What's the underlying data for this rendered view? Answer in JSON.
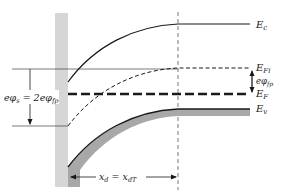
{
  "diagram": {
    "colors": {
      "line": "#1a1a1a",
      "oxide": "#d6d6d6",
      "valence_fill": "#a8a8a8",
      "guide": "#555555",
      "background": "#ffffff"
    },
    "labels": {
      "ec": {
        "main": "E",
        "sub": "c"
      },
      "efi": {
        "main": "E",
        "sub": "Fi"
      },
      "ef": {
        "main": "E",
        "sub": "F"
      },
      "ev": {
        "main": "E",
        "sub": "v"
      },
      "phi_fp": {
        "main": "eφ",
        "sub": "fp"
      },
      "phi_s": {
        "left_main": "eφ",
        "left_sub": "s",
        "eq": " = 2eφ",
        "right_sub": "fp"
      },
      "xd": {
        "left_main": "x",
        "left_sub": "d",
        "eq": " = x",
        "right_sub": "dT"
      }
    },
    "bands": [
      {
        "name": "Ec",
        "style": "solid"
      },
      {
        "name": "EFi",
        "style": "dashed"
      },
      {
        "name": "EF",
        "style": "thick-dashed"
      },
      {
        "name": "Ev",
        "style": "solid-shaded"
      }
    ]
  }
}
